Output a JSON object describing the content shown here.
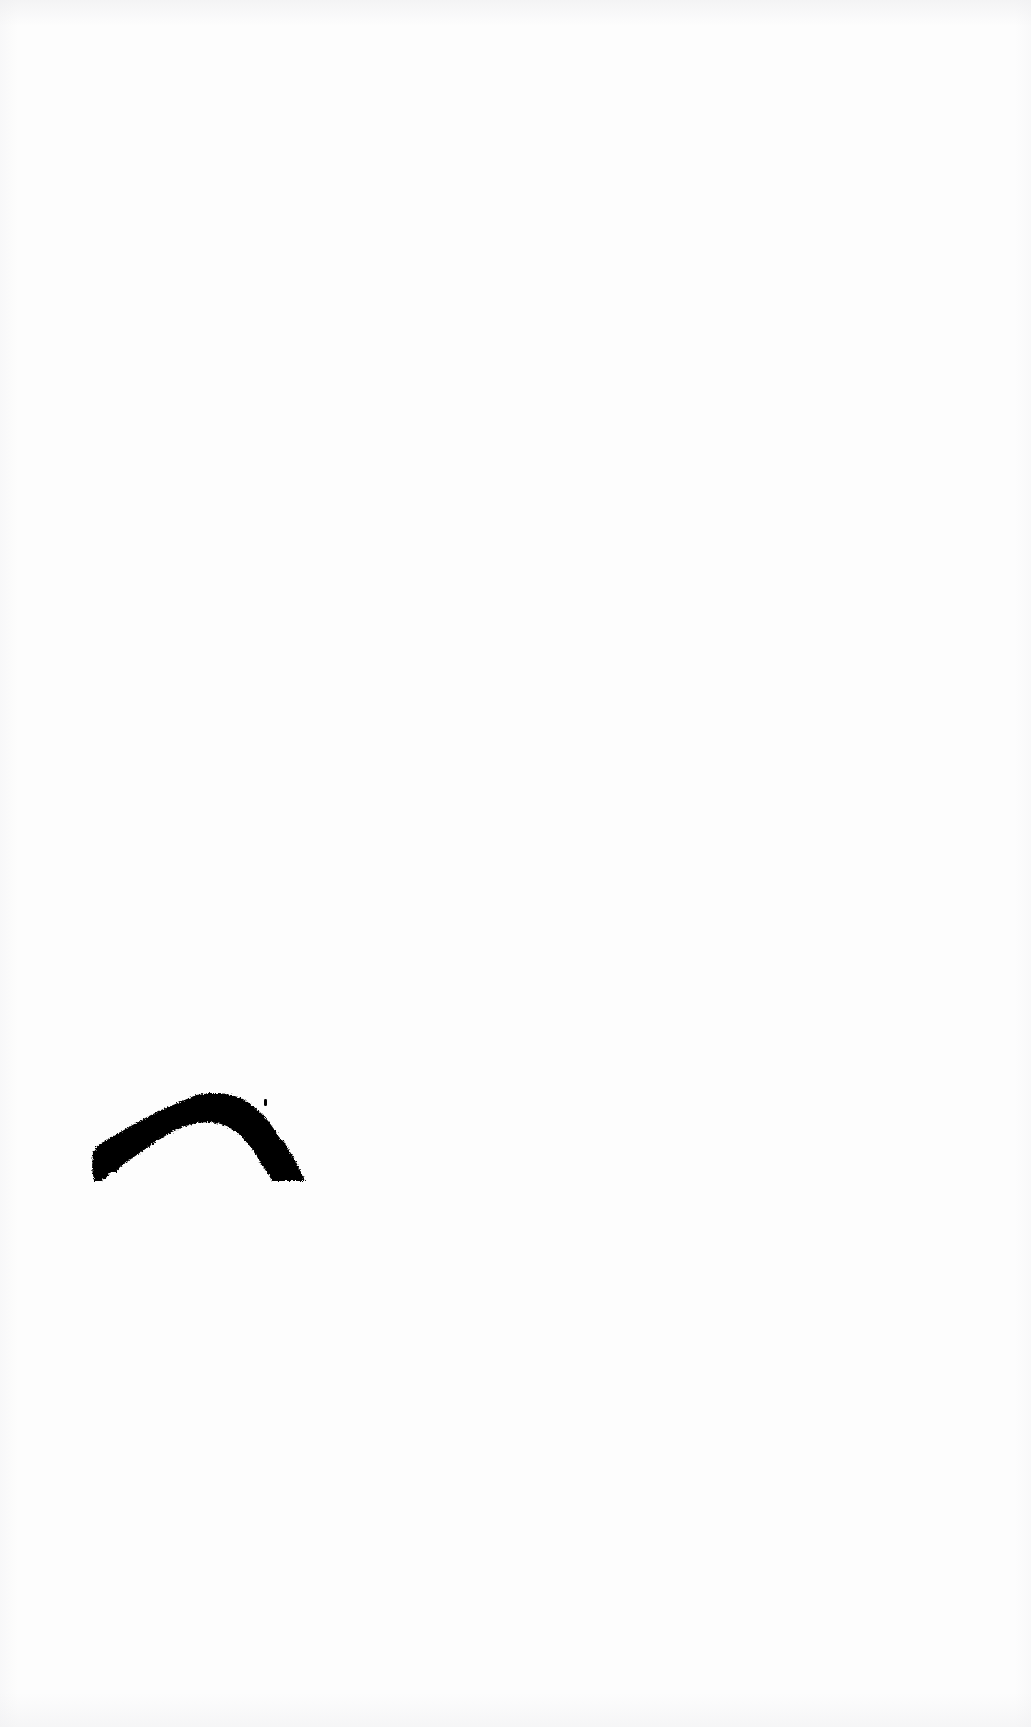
{
  "page": {
    "name": "scanned-page",
    "width": 1031,
    "height": 1727,
    "background_color": "#fdfdfd",
    "content_summary": "blank scanned page bearing a single solid black ink brushstroke"
  },
  "artwork": {
    "name": "ink-mark",
    "type": "brushstroke",
    "shape_description": "solid black arch / crescent brushstroke",
    "fill_color": "#000000",
    "bounding_box": {
      "x": 93,
      "y": 1093,
      "width": 214,
      "height": 88
    },
    "apex": {
      "x": 200,
      "y": 1093
    },
    "left_terminus": {
      "x": 93,
      "y": 1162
    },
    "right_terminus": {
      "x": 300,
      "y": 1180
    },
    "stroke_thickness_max": 46,
    "stroke_thickness_min": 22,
    "edge_texture": "ragged, stippled, thresholded scan edge",
    "speck": {
      "x": 265,
      "y": 1100,
      "width": 3,
      "height": 6
    },
    "outer_path": "M 93 1161 L 96 1147 L 104 1141 L 113 1136 L 124 1130 L 136 1123 L 149 1116 L 161 1110 L 173 1105 L 185 1100 L 196 1096 L 208 1093 L 220 1093 L 232 1095 L 243 1099 L 252 1105 L 261 1113 L 269 1122 L 276 1132 L 282 1143 L 288 1154 L 293 1164 L 298 1172 L 302 1178 L 305 1181 L 288 1181 L 272 1180 L 268 1174 L 262 1165 L 256 1155 L 249 1145 L 241 1136 L 232 1129 L 221 1124 L 209 1122 L 196 1123 L 183 1127 L 170 1133 L 157 1141 L 144 1150 L 131 1159 L 120 1167 L 116 1172 L 110 1172 L 106 1178 L 101 1181 L 95 1181 L 93 1172 Z"
  },
  "ui": {
    "has_chrome": false,
    "has_text": false,
    "has_controls": false
  }
}
